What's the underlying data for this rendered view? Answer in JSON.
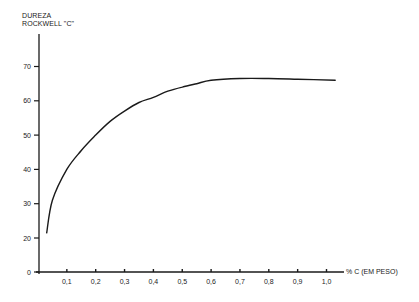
{
  "chart_data": {
    "type": "line",
    "title": "",
    "ylabel_lines": [
      "DUREZA",
      "ROCKWELL \"C\""
    ],
    "xlabel": "% C (EM PESO)",
    "xlim": [
      0,
      1.05
    ],
    "ylim": [
      0,
      70
    ],
    "y_axis_break": "compressed between 0 and 20",
    "grid": false,
    "legend": null,
    "x_ticks": [
      "0,1",
      "0,2",
      "0,3",
      "0,4",
      "0,5",
      "0,6",
      "0,7",
      "0,8",
      "0,9",
      "1,0"
    ],
    "x_tick_values": [
      0.1,
      0.2,
      0.3,
      0.4,
      0.5,
      0.6,
      0.7,
      0.8,
      0.9,
      1.0
    ],
    "y_ticks": [
      "0",
      "20",
      "30",
      "40",
      "50",
      "60",
      "70"
    ],
    "y_tick_values": [
      0,
      20,
      30,
      40,
      50,
      60,
      70
    ],
    "series": [
      {
        "name": "Dureza Rockwell C vs % C",
        "color": "#1a1a1a",
        "x": [
          0.03,
          0.05,
          0.1,
          0.15,
          0.2,
          0.25,
          0.3,
          0.35,
          0.4,
          0.45,
          0.5,
          0.55,
          0.6,
          0.7,
          0.8,
          0.9,
          1.03
        ],
        "y": [
          21.5,
          31,
          40,
          45.5,
          50,
          54,
          57,
          59.5,
          61,
          62.8,
          64,
          65,
          66,
          66.5,
          66.5,
          66.3,
          66
        ]
      }
    ]
  }
}
